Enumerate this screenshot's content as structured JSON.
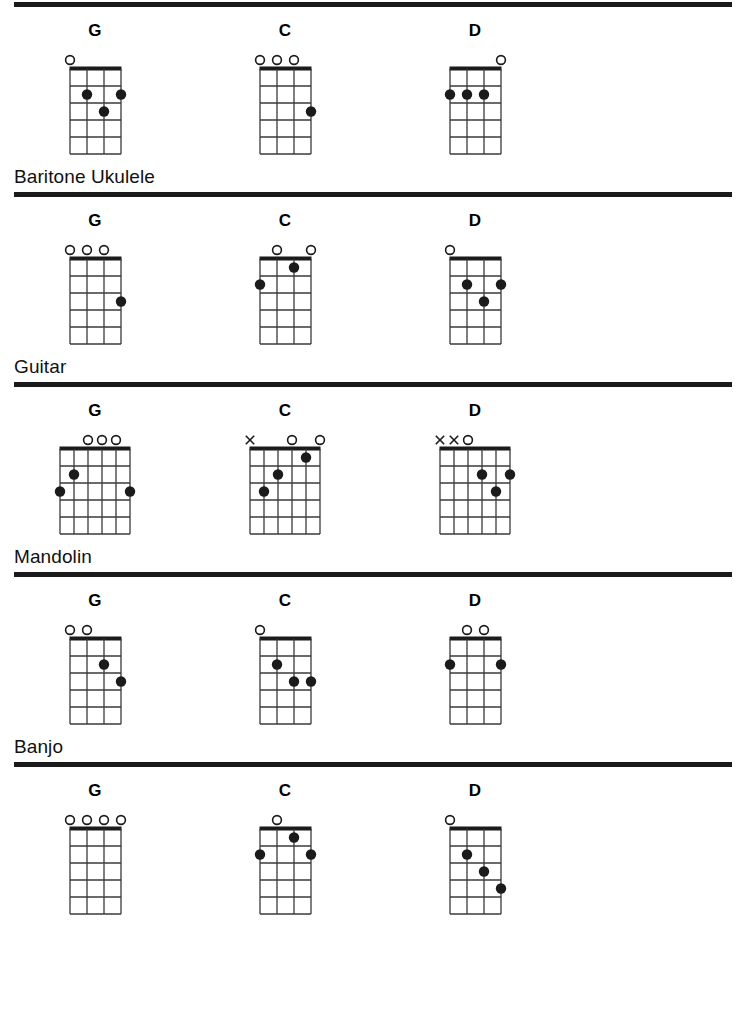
{
  "page": {
    "chord_names": [
      "G",
      "C",
      "D"
    ]
  },
  "chart_data": {
    "type": "table",
    "columns": [
      "G",
      "C",
      "D"
    ],
    "marker_legend": {
      "open": "O",
      "muted": "X",
      "fingered": "filled dot"
    },
    "sections": [
      {
        "instrument": "",
        "label": "",
        "strings": 4,
        "frets": 5,
        "chords": [
          {
            "name": "G",
            "open_strings": [
              1
            ],
            "muted_strings": [],
            "dots": [
              {
                "string": 2,
                "fret": 2
              },
              {
                "string": 4,
                "fret": 2
              },
              {
                "string": 3,
                "fret": 3
              }
            ]
          },
          {
            "name": "C",
            "open_strings": [
              1,
              2,
              3
            ],
            "muted_strings": [],
            "dots": [
              {
                "string": 4,
                "fret": 3
              }
            ]
          },
          {
            "name": "D",
            "open_strings": [
              4
            ],
            "muted_strings": [],
            "dots": [
              {
                "string": 1,
                "fret": 2
              },
              {
                "string": 2,
                "fret": 2
              },
              {
                "string": 3,
                "fret": 2
              }
            ]
          }
        ]
      },
      {
        "instrument": "baritone-ukulele",
        "label": "Baritone Ukulele",
        "strings": 4,
        "frets": 5,
        "chords": [
          {
            "name": "G",
            "open_strings": [
              1,
              2,
              3
            ],
            "muted_strings": [],
            "dots": [
              {
                "string": 4,
                "fret": 3
              }
            ]
          },
          {
            "name": "C",
            "open_strings": [
              2,
              4
            ],
            "muted_strings": [],
            "dots": [
              {
                "string": 3,
                "fret": 1
              },
              {
                "string": 1,
                "fret": 2
              }
            ]
          },
          {
            "name": "D",
            "open_strings": [
              1
            ],
            "muted_strings": [],
            "dots": [
              {
                "string": 2,
                "fret": 2
              },
              {
                "string": 4,
                "fret": 2
              },
              {
                "string": 3,
                "fret": 3
              }
            ]
          }
        ]
      },
      {
        "instrument": "guitar",
        "label": "Guitar",
        "strings": 6,
        "frets": 5,
        "chords": [
          {
            "name": "G",
            "open_strings": [
              3,
              4,
              5
            ],
            "muted_strings": [],
            "dots": [
              {
                "string": 2,
                "fret": 2
              },
              {
                "string": 1,
                "fret": 3
              },
              {
                "string": 6,
                "fret": 3
              }
            ]
          },
          {
            "name": "C",
            "open_strings": [
              4,
              6
            ],
            "muted_strings": [
              1
            ],
            "dots": [
              {
                "string": 5,
                "fret": 1
              },
              {
                "string": 3,
                "fret": 2
              },
              {
                "string": 2,
                "fret": 3
              }
            ]
          },
          {
            "name": "D",
            "open_strings": [
              3
            ],
            "muted_strings": [
              1,
              2
            ],
            "dots": [
              {
                "string": 4,
                "fret": 2
              },
              {
                "string": 6,
                "fret": 2
              },
              {
                "string": 5,
                "fret": 3
              }
            ]
          }
        ]
      },
      {
        "instrument": "mandolin",
        "label": "Mandolin",
        "strings": 4,
        "frets": 5,
        "chords": [
          {
            "name": "G",
            "open_strings": [
              1,
              2
            ],
            "muted_strings": [],
            "dots": [
              {
                "string": 3,
                "fret": 2
              },
              {
                "string": 4,
                "fret": 3
              }
            ]
          },
          {
            "name": "C",
            "open_strings": [
              1
            ],
            "muted_strings": [],
            "dots": [
              {
                "string": 2,
                "fret": 2
              },
              {
                "string": 3,
                "fret": 3
              },
              {
                "string": 4,
                "fret": 3
              }
            ]
          },
          {
            "name": "D",
            "open_strings": [
              2,
              3
            ],
            "muted_strings": [],
            "dots": [
              {
                "string": 1,
                "fret": 2
              },
              {
                "string": 4,
                "fret": 2
              }
            ]
          }
        ]
      },
      {
        "instrument": "banjo",
        "label": "Banjo",
        "strings": 4,
        "frets": 5,
        "chords": [
          {
            "name": "G",
            "open_strings": [
              1,
              2,
              3,
              4
            ],
            "muted_strings": [],
            "dots": []
          },
          {
            "name": "C",
            "open_strings": [
              2
            ],
            "muted_strings": [],
            "dots": [
              {
                "string": 3,
                "fret": 1
              },
              {
                "string": 1,
                "fret": 2
              },
              {
                "string": 4,
                "fret": 2
              }
            ]
          },
          {
            "name": "D",
            "open_strings": [
              1
            ],
            "muted_strings": [],
            "dots": [
              {
                "string": 2,
                "fret": 2
              },
              {
                "string": 3,
                "fret": 3
              },
              {
                "string": 4,
                "fret": 4
              }
            ]
          }
        ]
      }
    ]
  },
  "colors": {
    "ink": "#1b1b1b",
    "grid": "#3a3a3a",
    "paper": "#ffffff"
  }
}
